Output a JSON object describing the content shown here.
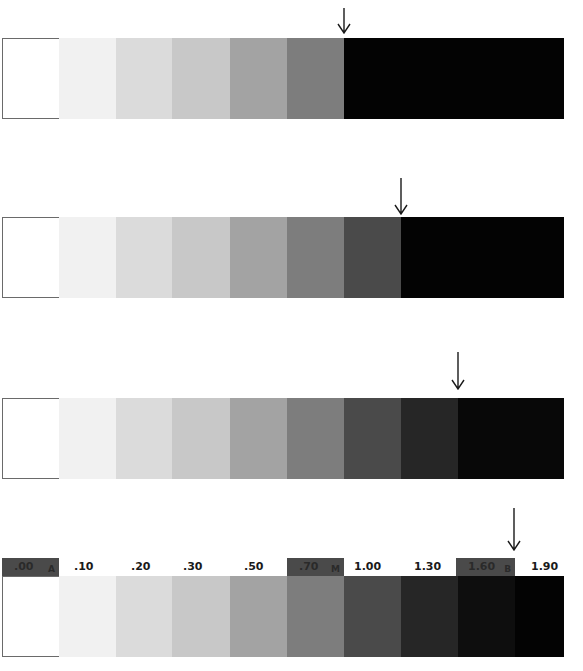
{
  "figure": {
    "type": "density step wedge comparison",
    "patch_width_px": 57,
    "strips": [
      {
        "id": "strip-1",
        "top": 38,
        "arrow_x": 344,
        "arrow_top": 8,
        "arrow_height": 26,
        "patches": [
          {
            "x": 0,
            "w": 57,
            "color": "#ffffff"
          },
          {
            "x": 57,
            "w": 57,
            "color": "#f1f1f1"
          },
          {
            "x": 114,
            "w": 56,
            "color": "#dbdbdb"
          },
          {
            "x": 170,
            "w": 58,
            "color": "#c8c8c8"
          },
          {
            "x": 228,
            "w": 57,
            "color": "#a3a3a3"
          },
          {
            "x": 285,
            "w": 57,
            "color": "#7d7d7d"
          },
          {
            "x": 342,
            "w": 220,
            "color": "#030303"
          }
        ]
      },
      {
        "id": "strip-2",
        "top": 217,
        "arrow_x": 401,
        "arrow_top": 178,
        "arrow_height": 37,
        "patches": [
          {
            "x": 0,
            "w": 57,
            "color": "#ffffff"
          },
          {
            "x": 57,
            "w": 57,
            "color": "#f1f1f1"
          },
          {
            "x": 114,
            "w": 56,
            "color": "#dbdbdb"
          },
          {
            "x": 170,
            "w": 58,
            "color": "#c8c8c8"
          },
          {
            "x": 228,
            "w": 57,
            "color": "#a3a3a3"
          },
          {
            "x": 285,
            "w": 57,
            "color": "#7d7d7d"
          },
          {
            "x": 342,
            "w": 57,
            "color": "#4a4a4a"
          },
          {
            "x": 399,
            "w": 163,
            "color": "#030303"
          }
        ]
      },
      {
        "id": "strip-3",
        "top": 398,
        "arrow_x": 458,
        "arrow_top": 352,
        "arrow_height": 38,
        "patches": [
          {
            "x": 0,
            "w": 57,
            "color": "#ffffff"
          },
          {
            "x": 57,
            "w": 57,
            "color": "#f1f1f1"
          },
          {
            "x": 114,
            "w": 56,
            "color": "#dbdbdb"
          },
          {
            "x": 170,
            "w": 58,
            "color": "#c8c8c8"
          },
          {
            "x": 228,
            "w": 57,
            "color": "#a3a3a3"
          },
          {
            "x": 285,
            "w": 57,
            "color": "#7d7d7d"
          },
          {
            "x": 342,
            "w": 57,
            "color": "#4a4a4a"
          },
          {
            "x": 399,
            "w": 57,
            "color": "#262626"
          },
          {
            "x": 456,
            "w": 106,
            "color": "#080808"
          }
        ]
      },
      {
        "id": "strip-4",
        "top": 576,
        "arrow_x": 514,
        "arrow_top": 508,
        "arrow_height": 43,
        "patches": [
          {
            "x": 0,
            "w": 57,
            "color": "#ffffff"
          },
          {
            "x": 57,
            "w": 57,
            "color": "#f1f1f1"
          },
          {
            "x": 114,
            "w": 56,
            "color": "#dbdbdb"
          },
          {
            "x": 170,
            "w": 58,
            "color": "#c8c8c8"
          },
          {
            "x": 228,
            "w": 57,
            "color": "#a3a3a3"
          },
          {
            "x": 285,
            "w": 57,
            "color": "#7d7d7d"
          },
          {
            "x": 342,
            "w": 57,
            "color": "#4a4a4a"
          },
          {
            "x": 399,
            "w": 57,
            "color": "#262626"
          },
          {
            "x": 456,
            "w": 57,
            "color": "#0e0e0e"
          },
          {
            "x": 513,
            "w": 49,
            "color": "#030303"
          }
        ]
      }
    ],
    "density_labels": [
      {
        "text": ".00",
        "tag": "A",
        "x": 2,
        "w": 57,
        "boxed": true
      },
      {
        "text": ".10",
        "tag": "",
        "x": 74,
        "w": 40,
        "boxed": false
      },
      {
        "text": ".20",
        "tag": "",
        "x": 131,
        "w": 40,
        "boxed": false
      },
      {
        "text": ".30",
        "tag": "",
        "x": 183,
        "w": 40,
        "boxed": false
      },
      {
        "text": ".50",
        "tag": "",
        "x": 244,
        "w": 40,
        "boxed": false
      },
      {
        "text": ".70",
        "tag": "M",
        "x": 287,
        "w": 57,
        "boxed": true
      },
      {
        "text": "1.00",
        "tag": "",
        "x": 354,
        "w": 40,
        "boxed": false
      },
      {
        "text": "1.30",
        "tag": "",
        "x": 414,
        "w": 40,
        "boxed": false
      },
      {
        "text": "1.60",
        "tag": "B",
        "x": 456,
        "w": 59,
        "boxed": true
      },
      {
        "text": "1.90",
        "tag": "",
        "x": 531,
        "w": 40,
        "boxed": false
      }
    ]
  }
}
